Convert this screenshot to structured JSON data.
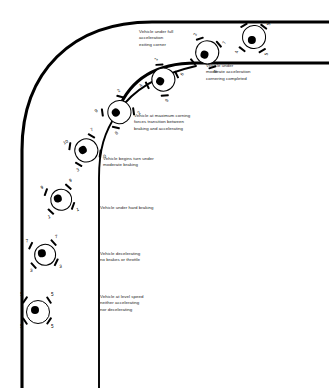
{
  "diagram": {
    "colors": {
      "track": "#000000",
      "text": "#1a1a1a",
      "tyre": "#000000",
      "body": "#ffffff"
    }
  },
  "track": {
    "outer_edge": "left-vertical sweeping right into top-horizontal",
    "inner_edge": "corner apex curve",
    "centerline": "dashed straight then curved racing line"
  },
  "annotations": [
    {
      "id": "label-full-accel",
      "text": "Vehicle under full\nacceleration\nexiting corner",
      "x": 139,
      "y": 29
    },
    {
      "id": "label-moderate-accel",
      "text": "Vehicle under\nmoderate acceleration\ncornering completed",
      "x": 206,
      "y": 63
    },
    {
      "id": "label-max-cornering",
      "text": "Vehicle at maximum corning\nforces transition between\nbraking and accelerating",
      "x": 134,
      "y": 113
    },
    {
      "id": "label-begins-turn",
      "text": "Vehicle begins turn under\nmoderate braking",
      "x": 103,
      "y": 156
    },
    {
      "id": "label-hard-braking",
      "text": "Vehicle under hard braking",
      "x": 100,
      "y": 205
    },
    {
      "id": "label-decelerating",
      "text": "Vehicle decelerating\nno brakes or throttle",
      "x": 100,
      "y": 251
    },
    {
      "id": "label-level-speed",
      "text": "Vehicle at level speed\nneither accelerating\nnor decelerating",
      "x": 100,
      "y": 294
    }
  ],
  "vehicles": [
    {
      "id": "vehicle-level-speed",
      "x": 37,
      "y": 311,
      "rot": 0,
      "scale": 1.0,
      "tyres": {
        "front_left": "5",
        "front_right": "5",
        "rear_left": "5",
        "rear_right": "5"
      }
    },
    {
      "id": "vehicle-decelerating",
      "x": 44,
      "y": 254,
      "rot": -8,
      "scale": 0.95,
      "tyres": {
        "front_left": "7",
        "front_right": "7",
        "rear_left": "3",
        "rear_right": "3"
      }
    },
    {
      "id": "vehicle-hard-braking",
      "x": 60,
      "y": 199,
      "rot": -14,
      "scale": 0.95,
      "tyres": {
        "front_left": "9",
        "front_right": "9",
        "rear_left": "1",
        "rear_right": "1"
      }
    },
    {
      "id": "vehicle-begins-turn",
      "x": 85,
      "y": 150,
      "rot": -26,
      "scale": 0.98,
      "tyres": {
        "front_left": "10",
        "front_right": "7",
        "rear_left": "3",
        "rear_right": "0"
      }
    },
    {
      "id": "vehicle-max-cornering",
      "x": 118,
      "y": 112,
      "rot": -42,
      "scale": 0.98,
      "tyres": {
        "front_left": "9",
        "front_right": "2",
        "rear_left": "8",
        "rear_right": "2"
      }
    },
    {
      "id": "vehicle-full-accel",
      "x": 162,
      "y": 80,
      "rot": -60,
      "scale": 0.98,
      "tyres": {
        "front_left": "4",
        "front_right": "1",
        "rear_left": "9",
        "rear_right": "6"
      }
    },
    {
      "id": "vehicle-exiting-corner",
      "x": 206,
      "y": 53,
      "rot": -74,
      "scale": 0.98,
      "tyres": {
        "front_left": "3",
        "front_right": "2",
        "rear_left": "8",
        "rear_right": "7"
      }
    },
    {
      "id": "vehicle-cornering-done",
      "x": 253,
      "y": 38,
      "rot": -86,
      "scale": 0.98,
      "tyres": {
        "front_left": "4",
        "front_right": "4",
        "rear_left": "5",
        "rear_right": "5"
      }
    }
  ]
}
